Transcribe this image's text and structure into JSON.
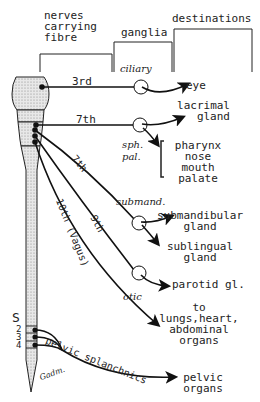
{
  "header": {
    "col1": [
      "nerves",
      "carrying",
      "fibre"
    ],
    "col2": "ganglia",
    "col3": "destinations"
  },
  "nerves": {
    "n3": "3rd",
    "n7a": "7th",
    "n7b": "7th",
    "n9": "9th",
    "n10": "10th (Vagus)",
    "pelvic": "pelvic splanchnics"
  },
  "ganglia": {
    "ciliary": "ciliary",
    "sph": "sph.",
    "pal": "pal.",
    "submand": "submand.",
    "otic": "otic"
  },
  "destinations": {
    "eye": "eye",
    "lacrimal": [
      "lacrimal",
      "gland"
    ],
    "sphpal_list": [
      "pharynx",
      "nose",
      "mouth",
      "palate"
    ],
    "submandibular": [
      "submandibular",
      "gland"
    ],
    "sublingual": [
      "sublingual",
      "gland"
    ],
    "parotid": "parotid gl.",
    "vagus": [
      "to",
      "lungs,heart,",
      "abdominal",
      "organs"
    ],
    "pelvic": [
      "pelvic",
      "organs"
    ]
  },
  "cord": {
    "S": "S",
    "segments": [
      "2",
      "3",
      "4"
    ],
    "signature": "Gadm."
  }
}
